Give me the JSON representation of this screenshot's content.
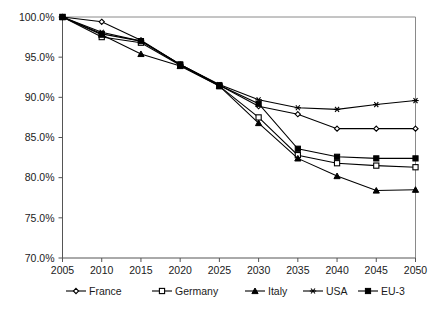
{
  "chart_data": {
    "type": "line",
    "title": "",
    "subtitle": "",
    "xlabel": "",
    "ylabel": "",
    "x": [
      2005,
      2010,
      2015,
      2020,
      2025,
      2030,
      2035,
      2040,
      2045,
      2050
    ],
    "xtick_labels": [
      "2005",
      "2010",
      "2015",
      "2020",
      "2025",
      "2030",
      "2035",
      "2040",
      "2045",
      "2050"
    ],
    "ytick_labels": [
      "70.0%",
      "75.0%",
      "80.0%",
      "85.0%",
      "90.0%",
      "95.0%",
      "100.0%"
    ],
    "ytick_values": [
      70.0,
      75.0,
      80.0,
      85.0,
      90.0,
      95.0,
      100.0
    ],
    "xlim": [
      2005,
      2050
    ],
    "ylim": [
      70.0,
      100.0
    ],
    "grid": false,
    "legend_position": "bottom",
    "series": [
      {
        "name": "France",
        "marker": "open-diamond",
        "values": [
          100.0,
          99.4,
          97.1,
          94.1,
          91.5,
          88.9,
          87.9,
          86.1,
          86.1,
          86.1
        ]
      },
      {
        "name": "Germany",
        "marker": "open-square",
        "values": [
          100.0,
          97.5,
          96.8,
          94.0,
          91.4,
          87.5,
          82.8,
          81.8,
          81.5,
          81.3
        ]
      },
      {
        "name": "Italy",
        "marker": "filled-triangle",
        "values": [
          100.0,
          97.8,
          95.4,
          93.9,
          91.4,
          86.8,
          82.4,
          80.2,
          78.4,
          78.5
        ]
      },
      {
        "name": "USA",
        "marker": "star",
        "values": [
          100.0,
          98.1,
          97.0,
          94.1,
          91.6,
          89.7,
          88.7,
          88.5,
          89.1,
          89.6
        ]
      },
      {
        "name": "EU-3",
        "marker": "filled-square",
        "values": [
          100.0,
          97.9,
          97.0,
          94.1,
          91.5,
          89.2,
          83.6,
          82.6,
          82.4,
          82.4
        ]
      }
    ],
    "legend": [
      {
        "label": "France",
        "marker": "open-diamond"
      },
      {
        "label": "Germany",
        "marker": "open-square"
      },
      {
        "label": "Italy",
        "marker": "filled-triangle"
      },
      {
        "label": "USA",
        "marker": "star"
      },
      {
        "label": "EU-3",
        "marker": "filled-square"
      }
    ],
    "colors": {
      "line": "#000000",
      "axis": "#555555",
      "frame": "#8a8a8a",
      "background": "#ffffff",
      "text": "#1a1a1a"
    }
  }
}
